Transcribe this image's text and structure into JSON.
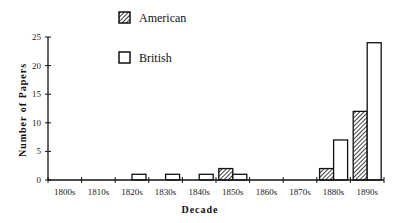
{
  "chart_data": {
    "type": "bar",
    "title": "",
    "xlabel": "Decade",
    "ylabel": "Number of Papers",
    "categories": [
      "1800s",
      "1810s",
      "1820s",
      "1830s",
      "1840s",
      "1850s",
      "1860s",
      "1870s",
      "1880s",
      "1890s"
    ],
    "series": [
      {
        "name": "American",
        "pattern": "diagonal-hatch",
        "values": [
          0,
          0,
          0,
          0,
          0,
          2,
          0,
          0,
          2,
          12
        ]
      },
      {
        "name": "British",
        "pattern": "hollow",
        "values": [
          0,
          0,
          1,
          1,
          1,
          1,
          0,
          0,
          7,
          24
        ]
      }
    ],
    "ylim": [
      0,
      25
    ],
    "yticks": [
      0,
      5,
      10,
      15,
      20,
      25
    ],
    "grid": false,
    "legend_position": "top-left-inside",
    "colors": {
      "axis": "#111111",
      "bar_stroke": "#111111",
      "bar_fill": "#ffffff",
      "hatch": "#111111"
    }
  }
}
